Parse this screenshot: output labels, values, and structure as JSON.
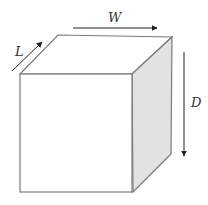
{
  "diagram": {
    "type": "3d-box-dimensions",
    "labels": {
      "width": "W",
      "length": "L",
      "depth": "D"
    },
    "colors": {
      "stroke": "#7a7a7a",
      "front_fill": "#ffffff",
      "side_fill": "#e2e2e2",
      "top_fill": "#ffffff",
      "arrow": "#222222",
      "label": "#333333"
    }
  }
}
